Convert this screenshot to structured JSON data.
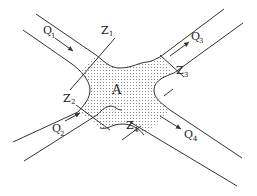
{
  "diagram": {
    "area_label": "A",
    "flows": [
      {
        "id": "Q1",
        "symbol": "Q",
        "index": "1",
        "direction": "inbound"
      },
      {
        "id": "Q2",
        "symbol": "Q",
        "index": "2",
        "direction": "inbound"
      },
      {
        "id": "Q3",
        "symbol": "Q",
        "index": "3",
        "direction": "outbound"
      },
      {
        "id": "Q4",
        "symbol": "Q",
        "index": "4",
        "direction": "outbound"
      }
    ],
    "boundaries": [
      {
        "id": "Z1",
        "symbol": "Z",
        "index": "1"
      },
      {
        "id": "Z2",
        "symbol": "Z",
        "index": "2"
      },
      {
        "id": "Z3",
        "symbol": "Z",
        "index": "3"
      },
      {
        "id": "Z4",
        "symbol": "Z",
        "index": "4"
      }
    ],
    "colors": {
      "line": "#333333",
      "dots": "#777777",
      "background": "#ffffff"
    }
  }
}
